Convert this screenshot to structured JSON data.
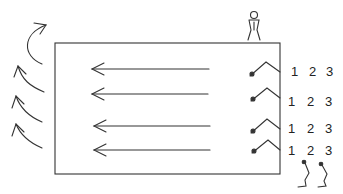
{
  "diagram": {
    "rows": [
      {
        "numbers": [
          "1",
          "2",
          "3"
        ]
      },
      {
        "numbers": [
          "1",
          "2",
          "3"
        ]
      },
      {
        "numbers": [
          "1",
          "2",
          "3"
        ]
      },
      {
        "numbers": [
          "1",
          "2",
          "3"
        ]
      }
    ],
    "colors": {
      "stroke": "#333333",
      "background": "#ffffff"
    }
  }
}
